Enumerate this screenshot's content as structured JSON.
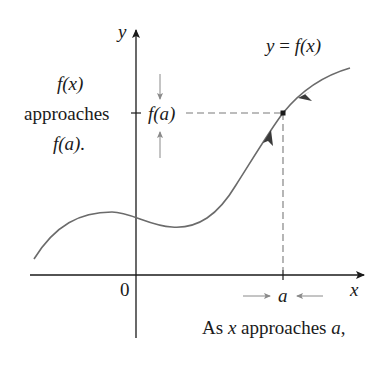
{
  "figure": {
    "type": "limit-concept-diagram",
    "axes": {
      "x_label": "x",
      "y_label": "y",
      "origin_label": "0"
    },
    "curve_label": {
      "lhs": "y",
      "eq": " = ",
      "rhs": "f(x)"
    },
    "point": {
      "x_label": "a",
      "y_label": "f(a)"
    },
    "left_caption": {
      "line1": "f(x)",
      "line2": "approaches",
      "line3": "f(a)."
    },
    "bottom_caption": {
      "prefix": "As ",
      "var": "x",
      "middle": " approaches ",
      "target": "a",
      "suffix": ","
    },
    "colors": {
      "axis": "#1a1a1a",
      "curve": "#6b6b6b",
      "dashed": "#7a7a7a",
      "arrows_small": "#8a8a8a",
      "text": "#1a1a1a"
    }
  }
}
